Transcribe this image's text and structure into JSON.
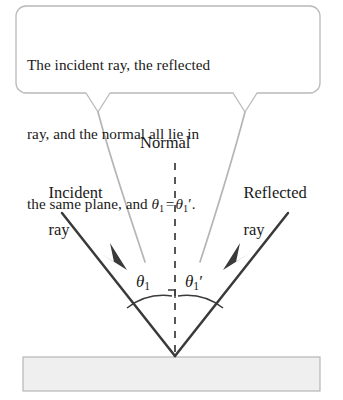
{
  "figure": {
    "type": "ray-diagram",
    "callout": {
      "lines": [
        "The incident ray, the reflected",
        "ray, and the normal all lie in",
        "the same plane, and "
      ],
      "equation": {
        "left_symbol": "θ",
        "left_subscript": "1",
        "relation": "=",
        "right_symbol": "θ",
        "right_subscript": "1",
        "right_prime": "′",
        "terminator": "."
      },
      "border_color": "#b9b9b9",
      "background": "#ffffff"
    },
    "labels": {
      "normal": "Normal",
      "incident_line1": "Incident",
      "incident_line2": "ray",
      "reflected_line1": "Reflected",
      "reflected_line2": "ray"
    },
    "angles": {
      "incident": {
        "symbol": "θ",
        "subscript": "1",
        "prime": ""
      },
      "reflected": {
        "symbol": "θ",
        "subscript": "1",
        "prime": "′"
      }
    },
    "colors": {
      "ray": "#3a3a3a",
      "leader": "#b5b5b5",
      "normal_dash": "#3a3a3a",
      "arc": "#3a3a3a",
      "mirror_fill": "#efefef",
      "mirror_border": "#b0b0b0",
      "text": "#1a1a1a"
    },
    "geometry": {
      "vertex": [
        175,
        356
      ],
      "incident_ray_start": [
        62,
        213
      ],
      "reflected_ray_end": [
        288,
        213
      ],
      "normal_top": [
        175,
        163
      ],
      "mirror_rect": [
        23,
        357,
        297,
        34
      ]
    }
  }
}
